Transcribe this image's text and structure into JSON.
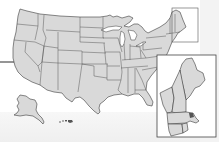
{
  "map": {
    "title": "United States",
    "inset": "New England",
    "colors": {
      "land": "#d9d9d9",
      "border": "#3a3a3a",
      "background": "#ffffff",
      "inset_frame": "#444444"
    },
    "regions": [
      "contiguous-us",
      "alaska",
      "hawaii",
      "new-england-inset"
    ]
  }
}
